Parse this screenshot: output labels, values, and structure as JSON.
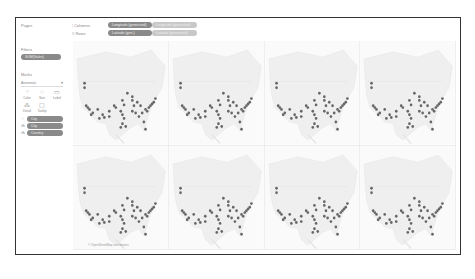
{
  "side_panel": {
    "pages_label": "Pages",
    "filters_label": "Filters",
    "filters": [
      {
        "label": "SUM(Sales)"
      }
    ],
    "marks_label": "Marks",
    "mark_type": "Automatic",
    "mark_buttons": [
      {
        "label": "Color",
        "icon": "color-icon",
        "glyph": "⁘"
      },
      {
        "label": "Size",
        "icon": "size-icon",
        "glyph": "◌"
      },
      {
        "label": "Label",
        "icon": "label-icon",
        "glyph": "▭"
      },
      {
        "label": "Detail",
        "icon": "detail-icon",
        "glyph": "⁂"
      },
      {
        "label": "Tooltip",
        "icon": "tooltip-icon",
        "glyph": "▢"
      }
    ],
    "mark_pills": [
      {
        "icon": "⁘",
        "label": "City"
      },
      {
        "icon": "⁂",
        "label": "City"
      },
      {
        "icon": "⁂",
        "label": "Country"
      }
    ]
  },
  "shelves": {
    "columns_label": "Columns",
    "columns_icon": "⫶",
    "columns_pills": [
      {
        "label": "Longitude (generated)",
        "style": "dark"
      },
      {
        "label": "Longitude (generated)",
        "style": "light"
      }
    ],
    "rows_label": "Rows",
    "rows_icon": "≡",
    "rows_pills": [
      {
        "label": "Latitude (gen.)",
        "style": "dark"
      },
      {
        "label": "Latitude (generated)",
        "style": "light"
      }
    ]
  },
  "map": {
    "panel_count": 8,
    "rows": 2,
    "cols": 4,
    "mark_color": "#666666",
    "land_color": "#efefef",
    "attribution": "© OpenStreetMap contributors"
  },
  "colors": {
    "frame_border": "#333333",
    "pill_dark": "#8a8a8a",
    "pill_light": "#c8c8c8"
  }
}
